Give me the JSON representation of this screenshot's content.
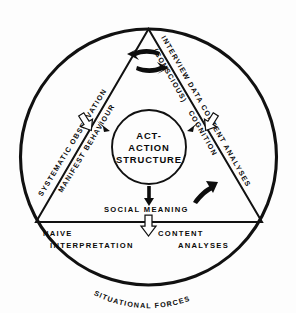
{
  "diagram": {
    "center": {
      "line1": "ACT-",
      "line2": "ACTION",
      "line3": "STRUCTURE"
    },
    "outer_labels": {
      "left": "SYSTEMATIC OBSERVATION",
      "right_upper": "INTERVIEW DATA",
      "right_lower": "CONTENT ANALYSES",
      "bottom_left_line1": "NAIVE",
      "bottom_left_line2": "INTERPRETATION",
      "bottom_right_line1": "CONTENT",
      "bottom_right_line2": "ANALYSES",
      "bottom_arc": "SITUATIONAL FORCES"
    },
    "inner_labels": {
      "left": "MANIFEST BEHAVIOUR",
      "right_upper": "(CONSCIOUS)",
      "right_lower": "COGNITION",
      "bottom": "SOCIAL MEANING"
    },
    "arrows": {
      "top_left_label": "behaviour-to-cognition",
      "top_right_label": "cognition-to-behaviour",
      "lower_right_label": "cognition-feedback",
      "inward_left_label": "observation-inflow",
      "inward_right_label": "interview-inflow",
      "inward_bottom_label": "meaning-outflow"
    },
    "colors": {
      "ink": "#111111",
      "paper": "#ffffff"
    }
  }
}
